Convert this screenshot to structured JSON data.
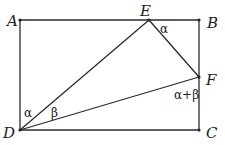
{
  "diagram": {
    "type": "geometry",
    "points": {
      "A": {
        "label": "A",
        "x": 20,
        "y": 20
      },
      "B": {
        "label": "B",
        "x": 199,
        "y": 20
      },
      "C": {
        "label": "C",
        "x": 199,
        "y": 130
      },
      "D": {
        "label": "D",
        "x": 20,
        "y": 130
      },
      "E": {
        "label": "E",
        "x": 149,
        "y": 20
      },
      "F": {
        "label": "F",
        "x": 199,
        "y": 77
      }
    },
    "segments": [
      "AB",
      "BC",
      "CD",
      "DA",
      "DE",
      "EF",
      "DF"
    ],
    "angles": {
      "at_E": "α",
      "at_D_ADE": "α",
      "at_D_EDF": "β",
      "at_F": "α+β"
    }
  }
}
